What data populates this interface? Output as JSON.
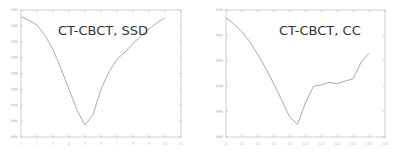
{
  "chart_data": [
    {
      "type": "line",
      "title": "CT-CBCT, SSD",
      "xlabel": "",
      "ylabel": "",
      "grid": false,
      "xlim": [
        1,
        11
      ],
      "ylim": [
        0,
        8
      ],
      "x_tick_labels": [
        "1",
        "2",
        "3",
        "4",
        "5",
        "6",
        "7",
        "8",
        "9",
        "10",
        "11"
      ],
      "y_tick_labels": [
        "",
        "",
        "",
        "",
        "",
        "",
        "",
        "",
        ""
      ],
      "line_color": "#aaaaaa",
      "x": [
        1,
        1.5,
        2,
        2.5,
        3,
        3.5,
        4,
        4.5,
        5,
        5.5,
        6,
        6.5,
        7,
        7.5,
        8,
        8.5,
        9,
        9.5,
        10
      ],
      "values": [
        7.6,
        7.35,
        7.05,
        6.4,
        5.5,
        4.3,
        3.0,
        1.7,
        0.75,
        1.4,
        3.0,
        4.1,
        4.9,
        5.35,
        5.9,
        6.35,
        6.8,
        7.2,
        7.5
      ]
    },
    {
      "type": "line",
      "title": "CT-CBCT, CC",
      "xlabel": "",
      "ylabel": "",
      "grid": false,
      "xlim": [
        0,
        200
      ],
      "ylim": [
        0,
        5
      ],
      "x_tick_labels": [
        "0",
        "20",
        "40",
        "60",
        "80",
        "100",
        "120",
        "140",
        "160",
        "180",
        "200"
      ],
      "y_tick_labels": [
        "",
        "",
        "",
        "",
        "",
        ""
      ],
      "line_color": "#aaaaaa",
      "x": [
        0,
        10,
        20,
        30,
        40,
        50,
        60,
        70,
        80,
        90,
        100,
        110,
        120,
        130,
        140,
        150,
        160,
        170,
        180
      ],
      "values": [
        4.7,
        4.45,
        4.15,
        3.75,
        3.25,
        2.7,
        2.1,
        1.45,
        0.8,
        0.5,
        1.35,
        2.0,
        2.05,
        2.15,
        2.1,
        2.2,
        2.3,
        2.95,
        3.3
      ]
    }
  ]
}
